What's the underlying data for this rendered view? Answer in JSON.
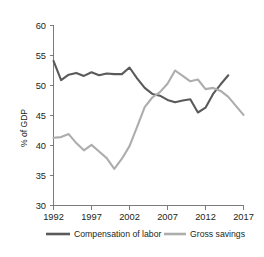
{
  "chart_data": {
    "type": "line",
    "title": "",
    "subtitle": "",
    "xlabel": "",
    "ylabel": "% of GDP",
    "xlim": [
      1992,
      2017
    ],
    "ylim": [
      30,
      60
    ],
    "ytick_labels": [
      "30",
      "35",
      "40",
      "45",
      "50",
      "55",
      "60"
    ],
    "ytick_values": [
      30,
      35,
      40,
      45,
      50,
      55,
      60
    ],
    "xtick_labels": [
      "1992",
      "1997",
      "2002",
      "2007",
      "2012",
      "2017"
    ],
    "xtick_values": [
      1992,
      1997,
      2002,
      2007,
      2012,
      2017
    ],
    "grid": false,
    "legend_position": "bottom",
    "x": [
      1992,
      1993,
      1994,
      1995,
      1996,
      1997,
      1998,
      1999,
      2000,
      2001,
      2002,
      2003,
      2004,
      2005,
      2006,
      2007,
      2008,
      2009,
      2010,
      2011,
      2012,
      2013,
      2014,
      2015,
      2016,
      2017
    ],
    "series": [
      {
        "name": "Compensation of labor",
        "color": "#5a5a5a",
        "values": [
          54.1,
          50.9,
          51.8,
          52.1,
          51.6,
          52.2,
          51.7,
          52.0,
          51.9,
          51.9,
          53.0,
          51.2,
          49.6,
          48.6,
          48.3,
          47.6,
          47.2,
          47.5,
          47.7,
          45.5,
          46.3,
          48.6,
          50.2,
          51.7,
          null,
          null
        ]
      },
      {
        "name": "Gross savings",
        "color": "#adadad",
        "values": [
          41.3,
          41.4,
          41.9,
          40.4,
          39.2,
          40.1,
          39.0,
          37.9,
          36.1,
          37.8,
          39.9,
          43.1,
          46.4,
          48.0,
          48.9,
          50.3,
          52.5,
          51.6,
          50.7,
          51.0,
          49.4,
          49.6,
          49.1,
          48.1,
          46.6,
          45.1
        ]
      }
    ]
  },
  "legend": {
    "items": [
      {
        "label": "Compensation of labor",
        "color": "#5a5a5a"
      },
      {
        "label": "Gross savings",
        "color": "#adadad"
      }
    ]
  }
}
